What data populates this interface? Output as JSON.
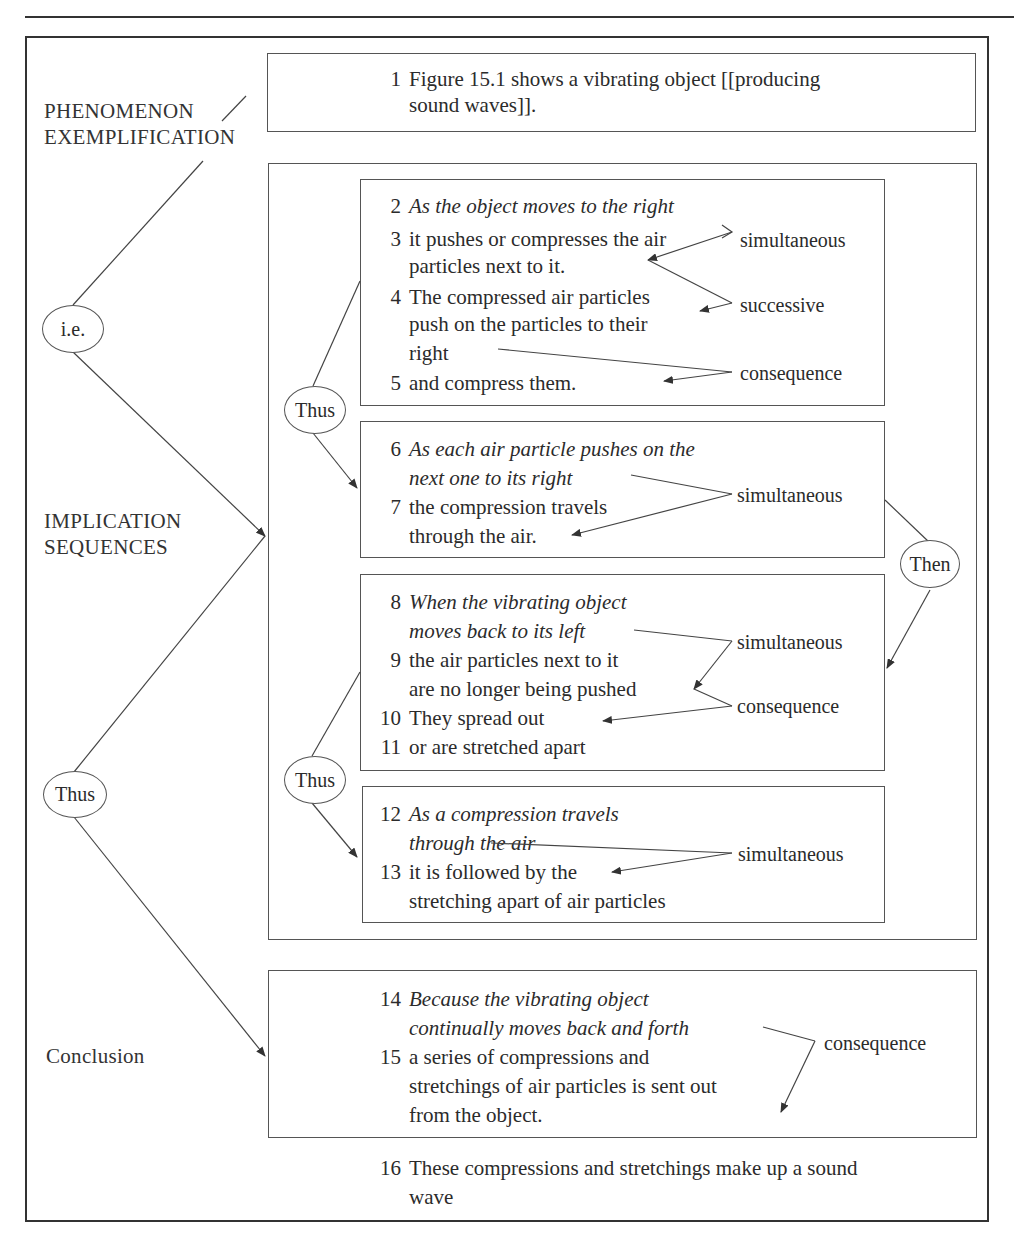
{
  "figure": {
    "stage_labels": {
      "phenomenon": [
        "PHENOMENON",
        "EXEMPLIFICATION"
      ],
      "implication": [
        "IMPLICATION",
        "SEQUENCES"
      ],
      "conclusion": "Conclusion"
    },
    "connectors": {
      "ie": "i.e.",
      "thus_main": "Thus",
      "thus_a": "Thus",
      "thus_b": "Thus",
      "then": "Then"
    },
    "box1": {
      "lines": [
        {
          "num": "1",
          "text": "Figure 15.1 shows a vibrating object [[producing",
          "italic": false
        },
        {
          "num": "",
          "text": "sound waves]].",
          "italic": false
        }
      ]
    },
    "box2": {
      "lines": [
        {
          "num": "2",
          "text": "As the object moves to the right",
          "italic": true
        },
        {
          "num": "3",
          "text": "it pushes or compresses the air",
          "italic": false
        },
        {
          "num": "",
          "text": "particles next to it.",
          "italic": false
        },
        {
          "num": "4",
          "text": "The compressed air particles",
          "italic": false
        },
        {
          "num": "",
          "text": "push on the particles to their",
          "italic": false
        },
        {
          "num": "",
          "text": "right",
          "italic": false
        },
        {
          "num": "5",
          "text": "and compress them.",
          "italic": false
        }
      ],
      "relations": [
        "simultaneous",
        "successive",
        "consequence"
      ]
    },
    "box3": {
      "lines": [
        {
          "num": "6",
          "text": "As each air particle pushes on the",
          "italic": true
        },
        {
          "num": "",
          "text": "next one to its right",
          "italic": true
        },
        {
          "num": "7",
          "text": "the compression travels",
          "italic": false
        },
        {
          "num": "",
          "text": "through the air.",
          "italic": false
        }
      ],
      "relations": [
        "simultaneous"
      ]
    },
    "box4": {
      "lines": [
        {
          "num": "8",
          "text": "When the vibrating object",
          "italic": true
        },
        {
          "num": "",
          "text": "moves back to its left",
          "italic": true
        },
        {
          "num": "9",
          "text": "the air particles next to it",
          "italic": false
        },
        {
          "num": "",
          "text": "are no longer being pushed",
          "italic": false
        },
        {
          "num": "10",
          "text": "They spread out",
          "italic": false
        },
        {
          "num": "11",
          "text": "or are stretched apart",
          "italic": false
        }
      ],
      "relations": [
        "simultaneous",
        "consequence"
      ]
    },
    "box5": {
      "lines": [
        {
          "num": "12",
          "text": "As a compression travels",
          "italic": true
        },
        {
          "num": "",
          "text": "through the air",
          "italic": true
        },
        {
          "num": "13",
          "text": "it is followed by the",
          "italic": false
        },
        {
          "num": "",
          "text": "stretching apart of air particles",
          "italic": false
        }
      ],
      "relations": [
        "simultaneous"
      ]
    },
    "box6": {
      "lines": [
        {
          "num": "14",
          "text": "Because the vibrating object",
          "italic": true
        },
        {
          "num": "",
          "text": "continually moves back and forth",
          "italic": true
        },
        {
          "num": "15",
          "text": "a series of compressions and",
          "italic": false
        },
        {
          "num": "",
          "text": "stretchings of air particles is sent out",
          "italic": false
        },
        {
          "num": "",
          "text": "from the object.",
          "italic": false
        }
      ],
      "relations": [
        "consequence"
      ]
    },
    "final": {
      "lines": [
        {
          "num": "16",
          "text": "These compressions and stretchings make up a sound",
          "italic": false
        },
        {
          "num": "",
          "text": "wave",
          "italic": false
        }
      ]
    }
  }
}
